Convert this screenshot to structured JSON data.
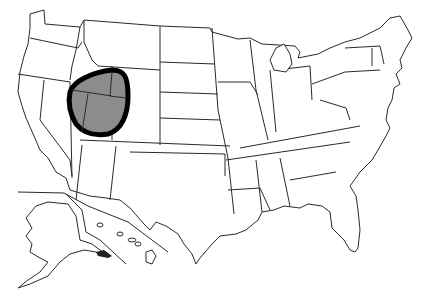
{
  "map": {
    "type": "outline-map",
    "subject": "United States (states with Alaska and Hawaii insets)",
    "highlight": {
      "description": "Shaded region circled with thick black outline over Utah area, including parts of Idaho, Wyoming and Nevada",
      "fill_color": "#8c8c8c",
      "outline_color": "#000000"
    },
    "colors": {
      "background": "#ffffff",
      "state_fill": "#ffffff",
      "state_border": "#2a2a2a"
    },
    "insets": [
      "Alaska",
      "Hawaii"
    ]
  }
}
